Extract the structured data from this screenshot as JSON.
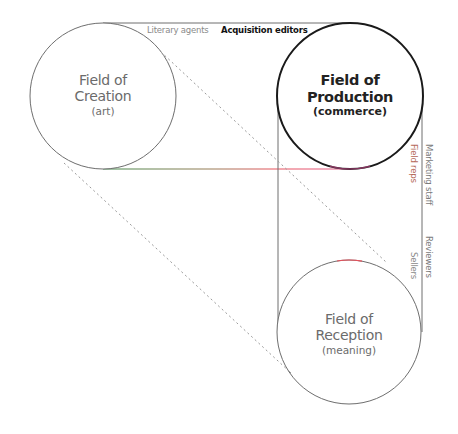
{
  "diagram": {
    "fields": {
      "creation": {
        "title_line1": "Field of",
        "title_line2": "Creation",
        "subtitle": "(art)"
      },
      "production": {
        "title_line1": "Field of",
        "title_line2": "Production",
        "subtitle": "(commerce)"
      },
      "reception": {
        "title_line1": "Field of",
        "title_line2": "Reception",
        "subtitle": "(meaning)"
      }
    },
    "connectors": {
      "literary_agents": "Literary agents",
      "acquisition_editors": "Acquisition editors",
      "marketing_staff": "Marketing staff",
      "field_reps": "Field reps",
      "reviewers": "Reviewers",
      "sellers": "Sellers"
    },
    "colors": {
      "line_gray": "#6e6e6e",
      "production_stroke": "#1a1a1a",
      "dashed": "#9a9a9a",
      "accent_red": "#e8505b",
      "accent_green": "#3f8a4a",
      "field_reps_text": "#b56a5a",
      "label_gray": "#777777"
    }
  }
}
